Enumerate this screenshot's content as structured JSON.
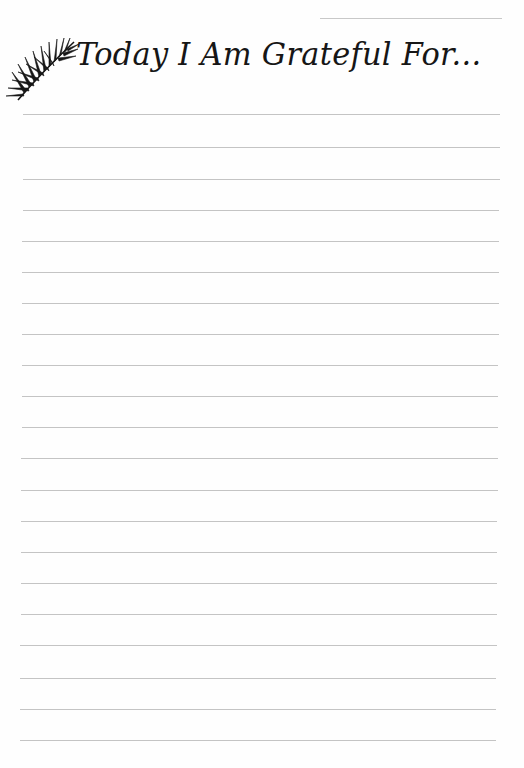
{
  "page": {
    "title": "Today I Am Grateful For...",
    "icon": "palm-leaf-icon",
    "date_field": "",
    "colors": {
      "background": "#fefefe",
      "ink": "#161616",
      "rule": "#c4c4c4"
    },
    "writing_lines": {
      "count": 21,
      "positions_y": [
        114,
        147,
        179,
        210,
        241,
        272,
        303,
        334,
        365,
        396,
        427,
        458,
        490,
        521,
        552,
        583,
        614,
        645,
        678,
        709,
        740
      ]
    }
  }
}
